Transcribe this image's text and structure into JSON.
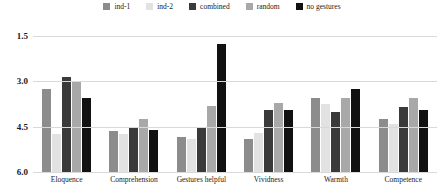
{
  "chart_data": {
    "type": "bar",
    "title": "",
    "xlabel": "",
    "ylabel": "",
    "ylim": [
      1.5,
      6.0
    ],
    "y_inverted": true,
    "grid": true,
    "legend_position": "top-center",
    "yticks": [
      "1.5",
      "3.0",
      "4.5",
      "6.0"
    ],
    "ytick_values": [
      1.5,
      3.0,
      4.5,
      6.0
    ],
    "categories": [
      "Eloquence",
      "Comprehension",
      "Gestures helpful",
      "Vividness",
      "Warmth",
      "Competence"
    ],
    "series": [
      {
        "name": "ind-1",
        "color": "#8c8c8c",
        "values": [
          4.25,
          2.85,
          2.65,
          2.6,
          3.95,
          3.25
        ]
      },
      {
        "name": "ind-2",
        "color": "#e2e2e2",
        "values": [
          2.75,
          2.75,
          2.6,
          2.8,
          3.75,
          3.1
        ]
      },
      {
        "name": "combined",
        "color": "#3a3a3a",
        "values": [
          4.65,
          2.95,
          3.0,
          3.55,
          3.5,
          3.65
        ]
      },
      {
        "name": "random",
        "color": "#a8a8a8",
        "values": [
          4.5,
          3.25,
          3.7,
          3.8,
          3.95,
          3.95
        ]
      },
      {
        "name": "no gestures",
        "color": "#111111",
        "values": [
          3.95,
          2.9,
          5.75,
          3.55,
          4.25,
          3.55
        ]
      }
    ]
  }
}
